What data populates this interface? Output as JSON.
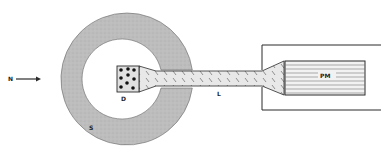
{
  "diagram": {
    "labels": {
      "incident": "N",
      "detector": "D",
      "light_guide": "L",
      "shield": "S",
      "photomultiplier": "PM"
    },
    "colors": {
      "line": "#2a2a2a",
      "shield_fill": "#bdbdbd",
      "guide_fill": "#e6e6e6",
      "pm_fill": "#f2f2f2",
      "background": "#ffffff"
    }
  }
}
